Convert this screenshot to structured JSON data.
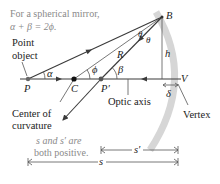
{
  "caption": {
    "line1": "For a spherical mirror,",
    "line2": "α + β = 2ϕ."
  },
  "labels": {
    "point_object": [
      "Point",
      "object"
    ],
    "center_of_curvature": [
      "Center of",
      "curvature"
    ],
    "optic_axis": "Optic axis",
    "vertex": "Vertex",
    "P": "P",
    "C": "C",
    "P_prime": "P′",
    "B": "B",
    "V": "V",
    "R": "R",
    "h": "h",
    "delta": "δ",
    "alpha": "α",
    "beta": "β",
    "phi": "ϕ",
    "theta1": "θ",
    "theta2": "θ",
    "s": "s",
    "s_prime": "s′"
  },
  "sign_note": {
    "line1": "s and s′ are",
    "line2": "both positive."
  },
  "colors": {
    "mirror": "#d4d4d4",
    "ray": "#3a3a3a",
    "note_text": "#8a8a8a",
    "point": "#111111"
  }
}
